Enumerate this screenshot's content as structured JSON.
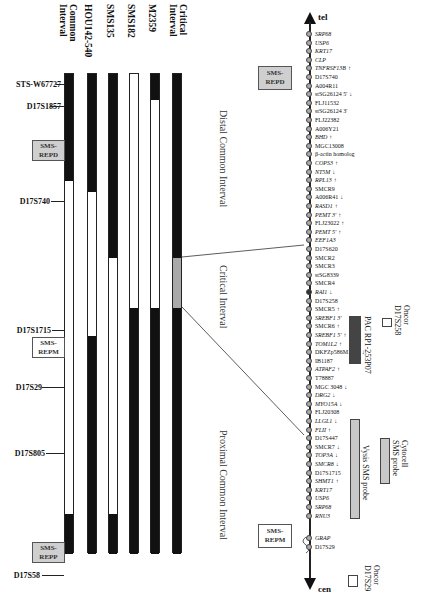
{
  "columns": [
    {
      "label": "Common\nInterval",
      "x": 55
    },
    {
      "label": "HOU142-540",
      "x": 80
    },
    {
      "label": "SMS135",
      "x": 101
    },
    {
      "label": "SMS182",
      "x": 122
    },
    {
      "label": "M2359",
      "x": 143
    },
    {
      "label": "Critical\nInterval",
      "x": 165
    }
  ],
  "markers": [
    {
      "label": "STS-W67727",
      "y": 84
    },
    {
      "label": "D17S1857",
      "y": 106
    },
    {
      "label": "D17S740",
      "y": 201
    },
    {
      "label": "D17S1715",
      "y": 330
    },
    {
      "label": "D17S29",
      "y": 387
    },
    {
      "label": "D17S805",
      "y": 453
    },
    {
      "label": "D17S58",
      "y": 575
    }
  ],
  "rep_boxes": {
    "left_repd": "SMS-\nREPD",
    "left_repm": "SMS-\nREPM",
    "left_repp": "SMS-\nREPP",
    "right_repd": "SMS-\nREPD",
    "right_repm": "SMS-\nREPM"
  },
  "regions": {
    "distal": "Distal Common Interval",
    "critical": "Critical Interval",
    "proximal": "Proximal Common Interval"
  },
  "axis": {
    "top_label": "tel",
    "bottom_label": "cen"
  },
  "genes": [
    {
      "name": "SRP68",
      "italic": true
    },
    {
      "name": "USP6",
      "italic": true
    },
    {
      "name": "KRT17",
      "italic": true
    },
    {
      "name": "CLP",
      "italic": true
    },
    {
      "name": "TNFRSF13B",
      "italic": true,
      "arrow": "up"
    },
    {
      "name": "D17S740",
      "italic": false
    },
    {
      "name": "A004R11",
      "italic": false
    },
    {
      "name": "stSG26124  5'",
      "italic": false,
      "arrow": "down"
    },
    {
      "name": "FLJ11532",
      "italic": false
    },
    {
      "name": "stSG26124  3'",
      "italic": false
    },
    {
      "name": "FLJ22382",
      "italic": false
    },
    {
      "name": "A006Y21",
      "italic": false
    },
    {
      "name": "BHD",
      "italic": true,
      "arrow": "up"
    },
    {
      "name": "MGC13008",
      "italic": false
    },
    {
      "name": "β-actin homolog",
      "italic": false
    },
    {
      "name": "COPS3",
      "italic": true,
      "arrow": "up"
    },
    {
      "name": "NT5M",
      "italic": true,
      "arrow": "down"
    },
    {
      "name": "RPL13",
      "italic": true,
      "arrow": "up"
    },
    {
      "name": "SMCR9",
      "italic": false
    },
    {
      "name": "A006R41",
      "italic": false,
      "arrow": "down"
    },
    {
      "name": "RASD1",
      "italic": true,
      "arrow": "up"
    },
    {
      "name": "PEMT 3'",
      "italic": true,
      "arrow": "up"
    },
    {
      "name": "FLJ23022",
      "italic": false,
      "arrow": "up"
    },
    {
      "name": "PEMT 5'",
      "italic": true,
      "arrow": "up"
    },
    {
      "name": "EEF1A3",
      "italic": true
    },
    {
      "name": "D17S620",
      "italic": false
    },
    {
      "name": "SMCR2",
      "italic": false
    },
    {
      "name": "SMCR3",
      "italic": false
    },
    {
      "name": "stSG8339",
      "italic": false
    },
    {
      "name": "SMCR4",
      "italic": false
    },
    {
      "name": "RAI1",
      "italic": true,
      "arrow": "down",
      "dark": true
    },
    {
      "name": "D17S258",
      "italic": false
    },
    {
      "name": "SMCR5",
      "italic": false,
      "arrow": "up"
    },
    {
      "name": "SREBF1 3'",
      "italic": true
    },
    {
      "name": "SMCR6",
      "italic": false,
      "arrow": "up"
    },
    {
      "name": "SREBF1 5'",
      "italic": true,
      "arrow": "up"
    },
    {
      "name": "TOM1L2",
      "italic": true,
      "arrow": "up"
    },
    {
      "name": "DKFZp586M1120",
      "italic": false,
      "arrow": "down"
    },
    {
      "name": "IB1187",
      "italic": false
    },
    {
      "name": "ATPAF2",
      "italic": true,
      "arrow": "up"
    },
    {
      "name": "T78887",
      "italic": false
    },
    {
      "name": "MGC 3048",
      "italic": false,
      "arrow": "down"
    },
    {
      "name": "DRG2",
      "italic": true,
      "arrow": "down"
    },
    {
      "name": "MYO15A",
      "italic": true,
      "arrow": "down"
    },
    {
      "name": "FLJ20308",
      "italic": false
    },
    {
      "name": "LLGL1",
      "italic": true,
      "arrow": "down"
    },
    {
      "name": "FLII",
      "italic": true,
      "arrow": "up"
    },
    {
      "name": "D17S447",
      "italic": false
    },
    {
      "name": "SMCR7",
      "italic": false,
      "arrow": "down"
    },
    {
      "name": "TOP3A",
      "italic": true,
      "arrow": "down"
    },
    {
      "name": "SMCR8",
      "italic": true,
      "arrow": "down"
    },
    {
      "name": "D17S1715",
      "italic": false
    },
    {
      "name": "SHMT1",
      "italic": true,
      "arrow": "up"
    },
    {
      "name": "KRT17",
      "italic": true
    },
    {
      "name": "USP6",
      "italic": true
    },
    {
      "name": "SRP68",
      "italic": true
    },
    {
      "name": "RNU3",
      "italic": true
    },
    {
      "name": "GRAP",
      "italic": true
    },
    {
      "name": "D17S29",
      "italic": false
    }
  ],
  "probes": {
    "pac": "PAC RP1-253P07",
    "oncor_top": "Oncor\nD17S258",
    "vysis": "Vysis SMS probe",
    "cytocell": "Cytocell\nSMS probe",
    "oncor_bottom": "Oncor\nD17S29"
  },
  "colors": {
    "black": "#111111",
    "grey": "#a9a9a9",
    "box_grey": "#cfcfcf",
    "probe_dark": "#444444"
  }
}
